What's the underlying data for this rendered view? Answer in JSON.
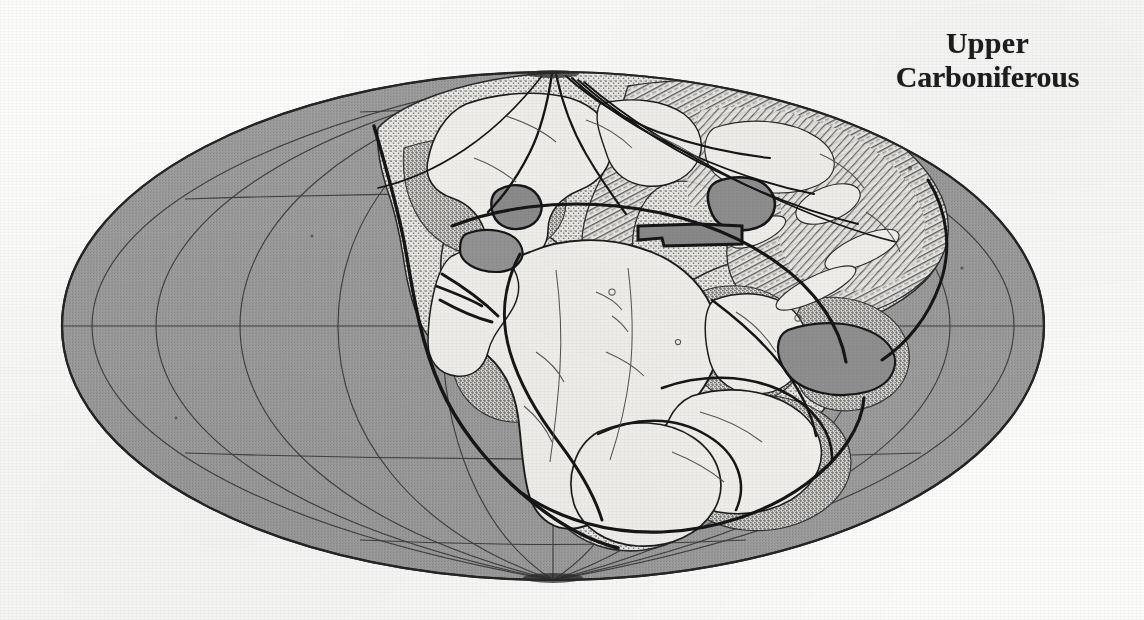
{
  "figure": {
    "kind": "paleogeographic-reconstruction-map",
    "title_line1": "Upper",
    "title_line2": "Carboniferous",
    "projection": "elliptical (Mollweide-style) globe",
    "colors": {
      "paper": "#fbfbfa",
      "ocean_gray": "#9a9a9a",
      "continent_light": "#f2f1ee",
      "shelf_stipple": "#6f6f6f",
      "ink": "#1d1d1d",
      "graticule": "#3a3a3a"
    },
    "ellipse": {
      "center_x": 553,
      "center_y": 326,
      "semi_width": 491,
      "semi_height": 254
    },
    "graticule": {
      "parallels_deg": [
        -60,
        -30,
        0,
        30,
        60
      ],
      "meridians_deg": [
        -150,
        -120,
        -90,
        -60,
        -30,
        0,
        30,
        60,
        90,
        120,
        150
      ],
      "pole_north_label": "north-pole-convergence",
      "pole_south_label": "south-pole-convergence",
      "equator_label": "equator"
    },
    "legend_regions": [
      {
        "name": "ocean",
        "fill": "solid gray"
      },
      {
        "name": "continental-shelf",
        "fill": "stippled"
      },
      {
        "name": "emergent-land",
        "fill": "light / blank"
      }
    ],
    "landmasses": [
      "Laurentia (North America)",
      "Baltica / Europe",
      "Angara / Siberia",
      "Africa",
      "South America",
      "India",
      "Australia",
      "Antarctica"
    ]
  }
}
